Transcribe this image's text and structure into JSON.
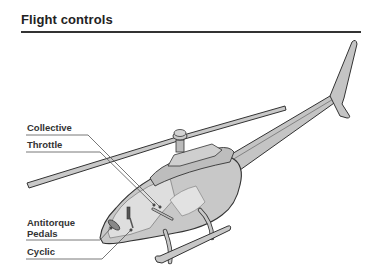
{
  "header": {
    "title": "Flight controls"
  },
  "diagram": {
    "labels": [
      {
        "id": "collective",
        "text": "Collective"
      },
      {
        "id": "throttle",
        "text": "Throttle"
      },
      {
        "id": "antitorque",
        "text": "Antitorque\nPedals",
        "line1": "Antitorque",
        "line2": "Pedals"
      },
      {
        "id": "cyclic",
        "text": "Cyclic"
      }
    ],
    "colors": {
      "body_fill": "#c8c8c8",
      "body_light": "#dedede",
      "outline": "#333333",
      "leader_line": "#555555",
      "text": "#333333"
    }
  }
}
